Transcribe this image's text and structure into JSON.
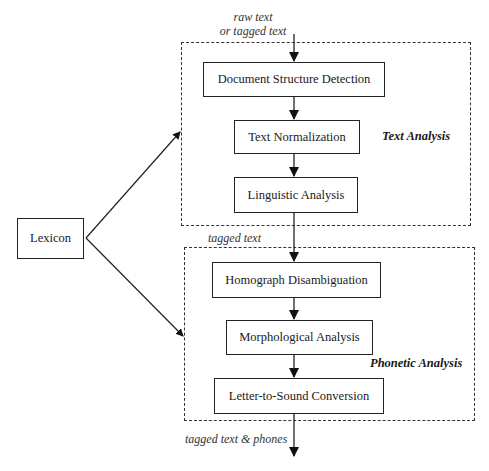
{
  "diagram": {
    "input_label_line1": "raw text",
    "input_label_line2": "or tagged text",
    "text_analysis": {
      "group_label": "Text Analysis",
      "steps": [
        {
          "label": "Document Structure Detection"
        },
        {
          "label": "Text Normalization"
        },
        {
          "label": "Linguistic Analysis"
        }
      ]
    },
    "intermediate_label": "tagged text",
    "phonetic_analysis": {
      "group_label": "Phonetic Analysis",
      "steps": [
        {
          "label": "Homograph Disambiguation"
        },
        {
          "label": "Morphological Analysis"
        },
        {
          "label": "Letter-to-Sound Conversion"
        }
      ]
    },
    "lexicon_label": "Lexicon",
    "output_label": "tagged text & phones"
  }
}
